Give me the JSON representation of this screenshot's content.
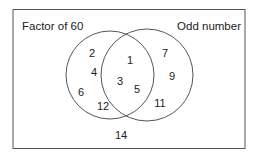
{
  "diagram": {
    "type": "venn",
    "sets": [
      {
        "label": "Factor of 60",
        "only": [
          "2",
          "4",
          "6",
          "12"
        ]
      },
      {
        "label": "Odd number",
        "only": [
          "7",
          "9",
          "11"
        ]
      }
    ],
    "intersection": [
      "1",
      "3",
      "5"
    ],
    "outside": [
      "14"
    ]
  },
  "labels": {
    "left": "Factor of 60",
    "right": "Odd number"
  },
  "numbers": {
    "n2": "2",
    "n4": "4",
    "n6": "6",
    "n12": "12",
    "n1": "1",
    "n3": "3",
    "n5": "5",
    "n7": "7",
    "n9": "9",
    "n11": "11",
    "n14": "14"
  }
}
